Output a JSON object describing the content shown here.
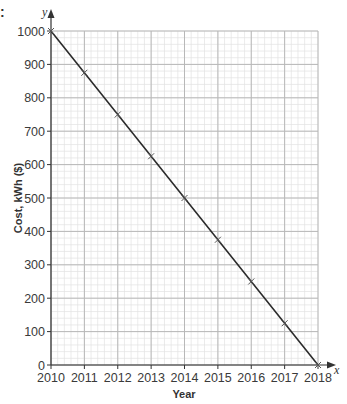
{
  "chart_data": {
    "type": "line",
    "title": "",
    "xlabel": "Year",
    "ylabel": "Cost, kWh ($)",
    "x_axis_var": "x",
    "y_axis_var": "y",
    "x": [
      2010,
      2011,
      2012,
      2013,
      2014,
      2015,
      2016,
      2017,
      2018
    ],
    "series": [
      {
        "name": "Cost",
        "values": [
          1000,
          875,
          750,
          625,
          500,
          375,
          250,
          125,
          0
        ],
        "marker": "x"
      }
    ],
    "xticks": [
      "2010",
      "2011",
      "2012",
      "2013",
      "2014",
      "2015",
      "2016",
      "2017",
      "2018"
    ],
    "yticks": [
      "0",
      "100",
      "200",
      "300",
      "400",
      "500",
      "600",
      "700",
      "800",
      "900",
      "1000"
    ],
    "xlim": [
      2010,
      2018
    ],
    "ylim": [
      0,
      1000
    ],
    "grid": true,
    "minor_grid_per_major": 5,
    "legend": null
  },
  "colors": {
    "line": "#2b2b2b",
    "major_grid": "#b8b8b8",
    "minor_grid": "#e2e2e2",
    "axis": "#333333"
  },
  "stray_mark": ":"
}
